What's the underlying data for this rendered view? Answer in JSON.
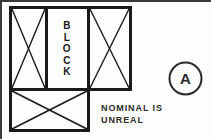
{
  "drawing": {
    "title": "BLOCK",
    "background_color": "#fdfdfb",
    "line_color": "#1a1a1a",
    "panels": {
      "left_panel": {
        "name": "left-bay",
        "marking": "diagonal-cross"
      },
      "center_panel": {
        "name": "center-bay",
        "label": "BLOCK"
      },
      "right_panel": {
        "name": "right-bay",
        "marking": "diagonal-cross"
      },
      "bottom_panel": {
        "name": "bottom-bay",
        "marking": "diagonal-cross"
      }
    },
    "block_label": {
      "text": "BLOCK",
      "letters": [
        "B",
        "L",
        "O",
        "C",
        "K"
      ],
      "orientation": "vertical-stacked"
    },
    "detail_marker": {
      "letter": "A",
      "shape": "circle"
    },
    "annotation": {
      "line_1": "NOMINAL IS",
      "line_2": "UNREAL"
    }
  }
}
